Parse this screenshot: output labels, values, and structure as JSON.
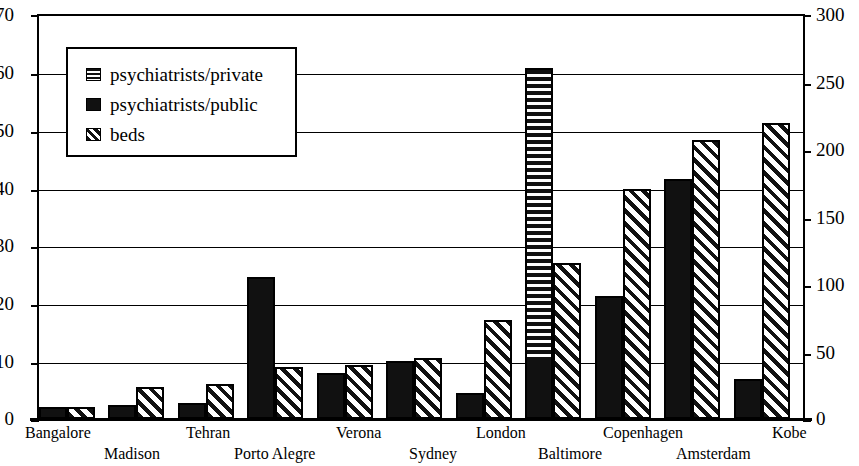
{
  "chart_data": {
    "type": "bar",
    "title": "",
    "subtitle": "",
    "xlabel": "",
    "ylabel": "",
    "y2label": "",
    "grid": true,
    "legend_position": "upper-left inside plot",
    "categories": [
      "Bangalore",
      "Madison",
      "Tehran",
      "Porto Alegre",
      "Verona",
      "Sydney",
      "London",
      "Baltimore",
      "Copenhagen",
      "Amsterdam",
      "Kobe"
    ],
    "left_axis": {
      "min": 0,
      "max": 70,
      "step": 10,
      "ticks": [
        "0",
        "10",
        "20",
        "30",
        "40",
        "50",
        "60",
        "70"
      ]
    },
    "right_axis": {
      "min": 0,
      "max": 300,
      "step": 50,
      "ticks": [
        "0",
        "50",
        "100",
        "150",
        "200",
        "250",
        "300"
      ]
    },
    "series": [
      {
        "name": "psychiatrists/public",
        "axis": "left",
        "pattern": "solid-black",
        "values": [
          2.0,
          2.5,
          2.7,
          24.5,
          8.0,
          10.0,
          4.5,
          10.3,
          21.2,
          41.5,
          7.0
        ]
      },
      {
        "name": "psychiatrists/private",
        "axis": "left",
        "pattern": "horizontal-stripes",
        "stacked_on": "psychiatrists/public",
        "values": [
          0,
          0,
          0,
          0,
          0,
          0,
          0,
          50.4,
          0,
          0,
          0
        ]
      },
      {
        "name": "beds",
        "axis": "right",
        "pattern": "diagonal-hatch",
        "values_left_scale": [
          2.0,
          5.5,
          6.0,
          9.0,
          9.3,
          10.5,
          17.2,
          27.0,
          39.7,
          48.3,
          51.2
        ],
        "values": [
          9,
          24,
          26,
          39,
          40,
          45,
          74,
          116,
          170,
          207,
          219
        ]
      }
    ],
    "stack_totals_left": [
      2.0,
      2.5,
      2.7,
      24.5,
      8.0,
      10.0,
      4.5,
      60.7,
      21.2,
      41.5,
      7.0
    ]
  },
  "legend": {
    "items": [
      {
        "label": "psychiatrists/private",
        "swatch": "horizontal-stripe-swatch"
      },
      {
        "label": "psychiatrists/public",
        "swatch": "solid-black-swatch"
      },
      {
        "label": "beds",
        "swatch": "diagonal-hatch-swatch"
      }
    ]
  },
  "axis_left": {
    "t0": "0",
    "t1": "10",
    "t2": "20",
    "t3": "30",
    "t4": "40",
    "t5": "50",
    "t6": "60",
    "t7": "70"
  },
  "axis_right": {
    "t0": "0",
    "t1": "50",
    "t2": "100",
    "t3": "150",
    "t4": "200",
    "t5": "250",
    "t6": "300"
  },
  "xlabels": {
    "l0": "Bangalore",
    "l1": "Madison",
    "l2": "Tehran",
    "l3": "Porto Alegre",
    "l4": "Verona",
    "l5": "Sydney",
    "l6": "London",
    "l7": "Baltimore",
    "l8": "Copenhagen",
    "l9": "Amsterdam",
    "l10": "Kobe"
  },
  "colors": {
    "ink": "#111111",
    "background": "#ffffff"
  }
}
